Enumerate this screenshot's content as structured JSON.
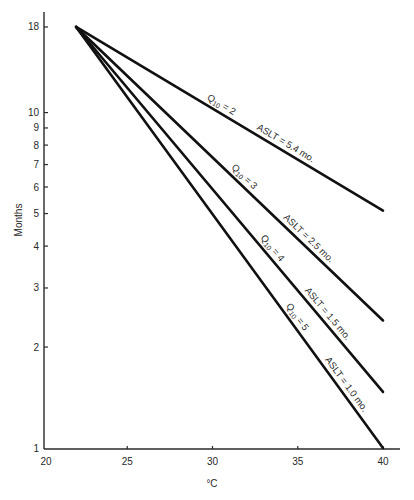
{
  "chart_data": {
    "type": "line",
    "title": "",
    "xlabel": "°C",
    "ylabel": "Months",
    "xlim": [
      20,
      40
    ],
    "ylim": [
      1,
      18
    ],
    "yscale": "log",
    "grid": false,
    "x_ticks": [
      20,
      25,
      30,
      35,
      40
    ],
    "y_ticks": [
      1,
      2,
      3,
      4,
      5,
      6,
      7,
      8,
      9,
      10,
      18
    ],
    "series": [
      {
        "name": "Q10 = 2",
        "q10": "2",
        "aslt": "ASLT = 5.4 mo.",
        "x": [
          22,
          40
        ],
        "y": [
          18,
          5.1
        ]
      },
      {
        "name": "Q10 = 3",
        "q10": "3",
        "aslt": "ASLT = 2.5 mo.",
        "x": [
          22,
          40
        ],
        "y": [
          18,
          2.4
        ]
      },
      {
        "name": "Q10 = 4",
        "q10": "4",
        "aslt": "ASLT = 1.5 mo.",
        "x": [
          22,
          40
        ],
        "y": [
          18,
          1.47
        ]
      },
      {
        "name": "Q10 = 5",
        "q10": "5",
        "aslt": "ASLT = 1.0 mo.",
        "x": [
          22,
          40
        ],
        "y": [
          18,
          1.0
        ]
      }
    ],
    "label_prefix": "Q",
    "label_subscript": "10",
    "label_eq": " = "
  }
}
